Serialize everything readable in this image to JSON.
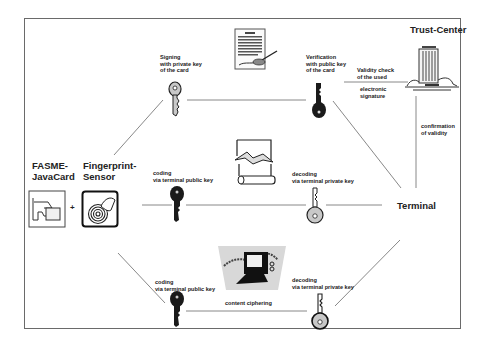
{
  "diagram": {
    "title_nodes": {
      "trust_center": "Trust-Center",
      "terminal": "Terminal",
      "card": "FASME-\nJavaCard",
      "sensor": "Fingerprint-\nSensor",
      "plus": "+"
    },
    "labels": {
      "signing": "Signing\nwith private key\nof the card",
      "verification": "Verification\nwith public key\nof the card",
      "validity_check": "Validity check\nof the used",
      "electronic_signature": "electronic\nsignature",
      "confirmation": "confirmation\nof validity",
      "coding_mid": "coding\nvia terminal public key",
      "decoding_mid": "decoding\nvia terminal private key",
      "coding_bottom": "coding\nvia terminal public key",
      "decoding_bottom": "decoding\nvia terminal private key",
      "content_ciphering": "content ciphering"
    },
    "icons": [
      "document-signing-icon",
      "office-building-icon",
      "scroll-icon",
      "computer-icon",
      "smartcard-icon",
      "fingerprint-icon",
      "key-icon"
    ],
    "colors": {
      "line": "#707070",
      "frame": "#6a6a6a",
      "key_light": "#c8c8c8",
      "key_dark": "#1a1a1a"
    }
  }
}
